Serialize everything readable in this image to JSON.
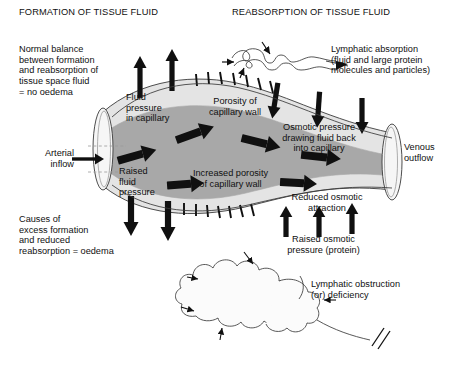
{
  "figure": {
    "title_left": "FORMATION OF TISSUE FLUID",
    "title_right": "REABSORPTION OF TISSUE FLUID"
  },
  "labels": {
    "normal_balance": "Normal balance\nbetween formation\nand reabsorption of\ntissue space fluid\n= no oedema",
    "causes": "Causes of\nexcess formation\nand reduced\nreabsorption = oedema",
    "arterial_inflow": "Arterial\ninflow",
    "venous_outflow": "Venous\noutflow",
    "fluid_pressure_in_capillary": "Fluid\npressure\nin capillary",
    "porosity_of_capillary_wall": "Porosity of\ncapillary wall",
    "osmotic_pressure_drawing": "Osmotic pressure\ndrawing fluid back\ninto capillary",
    "raised_fluid_pressure": "Raised\nfluid\npressure",
    "increased_porosity": "Increased porosity\nof capillary wall",
    "reduced_osmotic_attraction": "Reduced osmotic\nattraction",
    "raised_osmotic_pressure": "Raised osmotic\npressure (protein)",
    "lymphatic_absorption": "Lymphatic absorption\n(fluid and large protein\nmolecules and particles)",
    "lymphatic_obstruction": "Lymphatic obstruction\n(or) deficiency"
  },
  "colors": {
    "ink": "#101010",
    "outline": "#3a3a3a",
    "vessel_wall_fill": "#e4e4e4",
    "vessel_lumen_fill": "#a8a8a8",
    "cuff_fill": "#f2f2f2",
    "dashed_guide": "#9a9a9a",
    "background": "#ffffff"
  },
  "diagram": {
    "top_up_arrows": 2,
    "top_down_arrows": 3,
    "top_porosity_ticks": 9,
    "bottom_down_arrows": 2,
    "bottom_up_arrows": 3,
    "bottom_porosity_ticks": 7,
    "lumen_flow_arrows": 5,
    "lymph_vessel_inflow_arrows": 2,
    "cloud_inflow_arrows": 4,
    "break_marks": 2
  }
}
